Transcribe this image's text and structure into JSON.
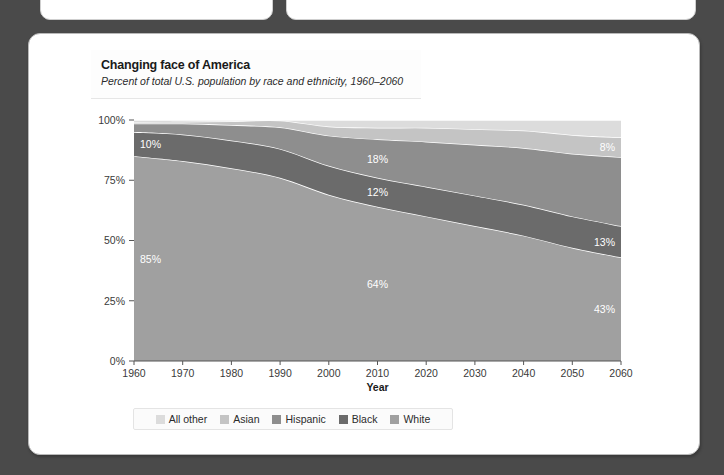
{
  "background_color": "#4a4a4a",
  "top_panels": [
    {
      "name": "partial-panel-left"
    },
    {
      "name": "partial-panel-right"
    }
  ],
  "card": {
    "title": "Changing face of America",
    "subtitle": "Percent of total U.S. population by race and ethnicity, 1960–2060"
  },
  "legend": {
    "items": [
      {
        "label": "All other",
        "color": "#dcdcdc"
      },
      {
        "label": "Asian",
        "color": "#c4c4c4"
      },
      {
        "label": "Hispanic",
        "color": "#8e8e8e"
      },
      {
        "label": "Black",
        "color": "#6b6b6b"
      },
      {
        "label": "White",
        "color": "#a0a0a0"
      }
    ]
  },
  "chart_data": {
    "type": "area",
    "title": "Changing face of America",
    "subtitle": "Percent of total U.S. population by race and ethnicity, 1960–2060",
    "xlabel": "Year",
    "ylabel": "",
    "grid": false,
    "legend_position": "bottom",
    "stacked": true,
    "xlim": [
      1960,
      2060
    ],
    "ylim": [
      0,
      100
    ],
    "x": [
      1960,
      1970,
      1980,
      1990,
      2000,
      2010,
      2020,
      2030,
      2040,
      2050,
      2060
    ],
    "xtick_labels": [
      "1960",
      "1970",
      "1980",
      "1990",
      "2000",
      "2010",
      "2020",
      "2030",
      "2040",
      "2050",
      "2060"
    ],
    "ytick_values": [
      0,
      25,
      50,
      75,
      100
    ],
    "ytick_labels": [
      "0%",
      "25%",
      "50%",
      "75%",
      "100%"
    ],
    "series": [
      {
        "name": "White",
        "color": "#a0a0a0",
        "values": [
          85,
          83,
          80,
          76,
          69,
          64,
          60,
          56,
          52,
          47,
          43
        ]
      },
      {
        "name": "Black",
        "color": "#6b6b6b",
        "values": [
          10,
          11,
          11.5,
          12,
          12,
          12,
          12.3,
          12.6,
          12.8,
          13,
          13
        ]
      },
      {
        "name": "Hispanic",
        "color": "#8e8e8e",
        "values": [
          3.5,
          4.5,
          6.4,
          9,
          12.5,
          16,
          18.7,
          21.1,
          23.6,
          26,
          28.6
        ]
      },
      {
        "name": "Asian",
        "color": "#c4c4c4",
        "values": [
          0.6,
          0.8,
          1.6,
          2.8,
          3.8,
          4.8,
          5.8,
          6.5,
          7.2,
          7.8,
          8.2
        ]
      },
      {
        "name": "All other",
        "color": "#dcdcdc",
        "values": [
          0.9,
          0.7,
          0.5,
          0.2,
          2.7,
          3.2,
          3.2,
          3.8,
          4.4,
          6.2,
          7.2
        ]
      }
    ],
    "annotations": [
      {
        "text": "10%",
        "series": "Black",
        "x": 1960,
        "anchor": "start"
      },
      {
        "text": "85%",
        "series": "White",
        "x": 1960,
        "anchor": "start"
      },
      {
        "text": "18%",
        "series": "Hispanic",
        "x": 2010,
        "anchor": "middle"
      },
      {
        "text": "12%",
        "series": "Black",
        "x": 2010,
        "anchor": "middle"
      },
      {
        "text": "64%",
        "series": "White",
        "x": 2010,
        "anchor": "middle"
      },
      {
        "text": "8%",
        "series": "Asian",
        "x": 2060,
        "anchor": "end"
      },
      {
        "text": "13%",
        "series": "Black",
        "x": 2060,
        "anchor": "end"
      },
      {
        "text": "43%",
        "series": "White",
        "x": 2060,
        "anchor": "end"
      }
    ]
  }
}
